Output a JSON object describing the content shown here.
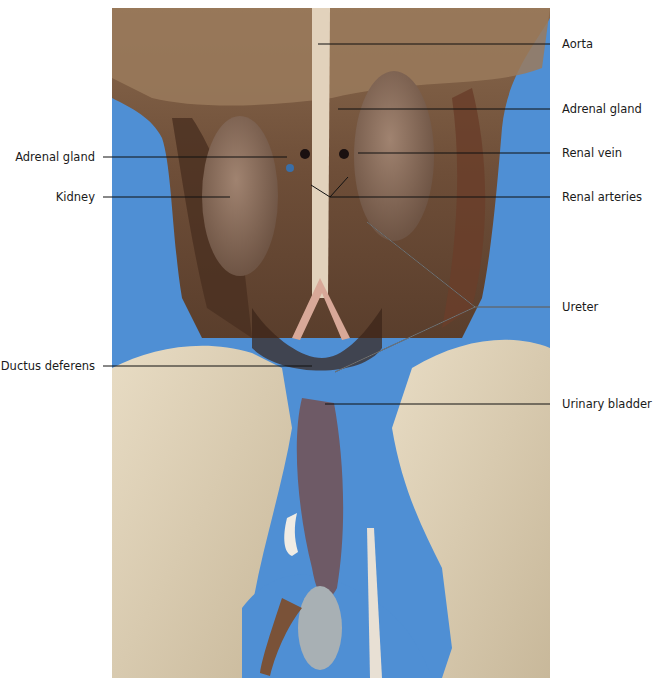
{
  "figure": {
    "background_color": "#4f8fd4",
    "labels_right": [
      {
        "text": "Aorta",
        "y": 44
      },
      {
        "text": "Adrenal gland",
        "y": 109
      },
      {
        "text": "Renal vein",
        "y": 153
      },
      {
        "text": "Renal arteries",
        "y": 197
      },
      {
        "text": "Ureter",
        "y": 307
      },
      {
        "text": "Urinary bladder",
        "y": 404
      }
    ],
    "labels_left": [
      {
        "text": "Adrenal gland",
        "y": 157
      },
      {
        "text": "Kidney",
        "y": 197
      },
      {
        "text": "Ductus deferens",
        "y": 366
      }
    ]
  }
}
